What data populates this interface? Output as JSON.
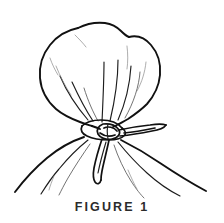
{
  "document": {
    "type": "patent-line-drawing",
    "background_color": "#ffffff",
    "ink_color": "#111111"
  },
  "illustration": {
    "name": "drawstring-hood-tied-at-neck",
    "description": "Line drawing of a gathered bag or hood over a head, cinched at the neck with a cord tied in a knot, cord ends hanging down and one long tail extending to the right, over draped shoulders",
    "elements": [
      {
        "name": "hood-outline",
        "label": "Gathered hood"
      },
      {
        "name": "gather-folds",
        "label": "Gathered folds"
      },
      {
        "name": "neck-cord",
        "label": "Drawstring cord"
      },
      {
        "name": "cord-knot",
        "label": "Knot"
      },
      {
        "name": "cord-tail-right",
        "label": "Cord tail"
      },
      {
        "name": "cord-ends-hanging",
        "label": "Hanging cord ends"
      },
      {
        "name": "left-shoulder",
        "label": "Left shoulder"
      },
      {
        "name": "right-shoulder",
        "label": "Right shoulder"
      },
      {
        "name": "drape-lines",
        "label": "Drape lines"
      }
    ]
  },
  "caption": {
    "text": "FIGURE 1"
  }
}
